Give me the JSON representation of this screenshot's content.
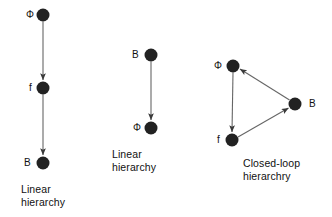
{
  "figure": {
    "background_color": "#ffffff",
    "node_color": "#222222",
    "edge_color": "#555555",
    "text_color": "#111111",
    "panels": [
      {
        "id": "left-panel",
        "caption": "Linear\nhierarchy",
        "caption_x": 21,
        "caption_y": 183,
        "nodes": [
          {
            "id": "phi",
            "label": "Φ",
            "cx": 43,
            "cy": 15,
            "r": 6.5,
            "label_x": 26,
            "label_y": 10
          },
          {
            "id": "f",
            "label": "f",
            "cx": 43,
            "cy": 88,
            "r": 6.5,
            "label_x": 29,
            "label_y": 83
          },
          {
            "id": "b",
            "label": "B",
            "cx": 43,
            "cy": 163,
            "r": 6.5,
            "label_x": 24,
            "label_y": 158
          }
        ],
        "edges": [
          {
            "from": "phi",
            "to": "f",
            "arrow": true
          },
          {
            "from": "f",
            "to": "b",
            "arrow": true
          }
        ]
      },
      {
        "id": "middle-panel",
        "caption": "Linear\nhierarchy",
        "caption_x": 112,
        "caption_y": 148,
        "nodes": [
          {
            "id": "b",
            "label": "B",
            "cx": 151,
            "cy": 55,
            "r": 6.5,
            "label_x": 132,
            "label_y": 50
          },
          {
            "id": "phi",
            "label": "Φ",
            "cx": 151,
            "cy": 128,
            "r": 6.5,
            "label_x": 133,
            "label_y": 123
          }
        ],
        "edges": [
          {
            "from": "b",
            "to": "phi",
            "arrow": true
          }
        ]
      },
      {
        "id": "right-panel",
        "caption": "Closed-loop\nhierarchry",
        "caption_x": 243,
        "caption_y": 157,
        "nodes": [
          {
            "id": "phi",
            "label": "Φ",
            "cx": 233,
            "cy": 66,
            "r": 6.5,
            "label_x": 214,
            "label_y": 61
          },
          {
            "id": "f",
            "label": "f",
            "cx": 232,
            "cy": 140,
            "r": 6.5,
            "label_x": 217,
            "label_y": 135
          },
          {
            "id": "b",
            "label": "B",
            "cx": 295,
            "cy": 104,
            "r": 6.5,
            "label_x": 309,
            "label_y": 99
          }
        ],
        "edges": [
          {
            "from": "phi",
            "to": "f",
            "arrow": true
          },
          {
            "from": "f",
            "to": "b",
            "arrow": true
          },
          {
            "from": "b",
            "to": "phi",
            "arrow": true
          }
        ]
      }
    ]
  }
}
